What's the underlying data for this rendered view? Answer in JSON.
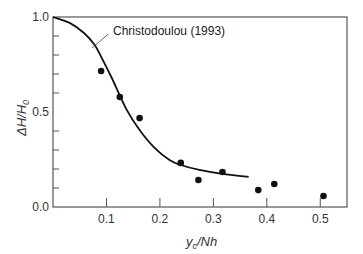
{
  "chart_data": {
    "type": "scatter",
    "title": "",
    "xlabel": "y_c/Nh",
    "xlabel_main": "y",
    "xlabel_sub": "c",
    "xlabel_rest": "/Nh",
    "ylabel": "ΔH/H_0",
    "ylabel_main": "ΔH/H",
    "ylabel_sub": "0",
    "xlim": [
      0,
      0.55
    ],
    "ylim": [
      0,
      1.0
    ],
    "grid": false,
    "x_ticks": [
      0.1,
      0.2,
      0.3,
      0.4,
      0.5
    ],
    "x_tick_labels": [
      "0.1",
      "0.2",
      "0.3",
      "0.4",
      "0.5"
    ],
    "y_ticks_labeled": [
      0.0,
      0.5,
      1.0
    ],
    "y_tick_labels": [
      "0.0",
      "0.5",
      "1.0"
    ],
    "y_minor_ticks": [
      0.1,
      0.2,
      0.3,
      0.4,
      0.6,
      0.7,
      0.8,
      0.9
    ],
    "series": [
      {
        "name": "Experimental data",
        "kind": "scatter",
        "color": "#111111",
        "x": [
          0.09,
          0.125,
          0.162,
          0.239,
          0.272,
          0.317,
          0.384,
          0.414,
          0.506
        ],
        "y": [
          0.716,
          0.579,
          0.468,
          0.232,
          0.142,
          0.184,
          0.089,
          0.121,
          0.058
        ]
      },
      {
        "name": "Christodoulou (1993)",
        "kind": "line",
        "color": "#111111",
        "x": [
          0.0,
          0.032,
          0.058,
          0.078,
          0.093,
          0.11,
          0.138,
          0.162,
          0.19,
          0.218,
          0.239,
          0.274,
          0.317,
          0.366
        ],
        "y": [
          1.0,
          0.968,
          0.916,
          0.853,
          0.774,
          0.679,
          0.511,
          0.405,
          0.311,
          0.247,
          0.221,
          0.195,
          0.174,
          0.158
        ]
      }
    ],
    "annotations": [
      {
        "text": "Christodoulou (1993)",
        "points_to_series": "Christodoulou (1993)",
        "arrow_from": [
          0.1,
          0.83
        ],
        "arrow_to": [
          0.073,
          0.835
        ]
      }
    ]
  }
}
